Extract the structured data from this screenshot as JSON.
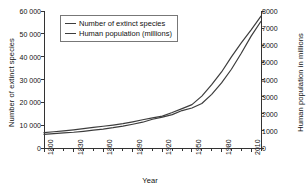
{
  "chart_data": {
    "type": "line",
    "title": "",
    "xlabel": "Year",
    "ylabel": "Number of extinct species",
    "ylabel_right": "Human population in millions",
    "xlim": [
      1800,
      2020
    ],
    "ylim": [
      0,
      60000
    ],
    "ylim_right": [
      0,
      8000
    ],
    "grid": false,
    "legend_position": "top-left-inside",
    "xticks": [
      1800,
      1830,
      1860,
      1890,
      1920,
      1950,
      1980,
      2010
    ],
    "xtick_labels": [
      "1800",
      "1830",
      "1860",
      "1890",
      "1920",
      "1950",
      "1980",
      "2010"
    ],
    "xminor_step": 10,
    "yticks_left": [
      0,
      10000,
      20000,
      30000,
      40000,
      50000,
      60000
    ],
    "ytick_labels_left": [
      "0",
      "10 000",
      "20 000",
      "30 000",
      "40 000",
      "50 000",
      "60 000"
    ],
    "yticks_right": [
      0,
      1000,
      2000,
      3000,
      4000,
      5000,
      6000,
      7000,
      8000
    ],
    "ytick_labels_right": [
      "0",
      "1000",
      "2000",
      "3000",
      "4000",
      "5000",
      "6000",
      "7000",
      "8000"
    ],
    "x": [
      1800,
      1810,
      1820,
      1830,
      1840,
      1850,
      1860,
      1870,
      1880,
      1890,
      1900,
      1910,
      1920,
      1930,
      1940,
      1950,
      1960,
      1970,
      1980,
      1990,
      2000,
      2010,
      2020
    ],
    "series": [
      {
        "name": "Number of extinct species",
        "axis": "left",
        "color": "#3d3d3d",
        "values": [
          6000,
          6300,
          6600,
          6900,
          7300,
          7800,
          8300,
          8900,
          9600,
          10400,
          11300,
          12600,
          13500,
          14600,
          16400,
          17500,
          19500,
          23500,
          28500,
          34500,
          41500,
          49000,
          55500
        ]
      },
      {
        "name": "Human population (millions)",
        "axis": "right",
        "color": "#3d3d3d",
        "values": [
          900,
          950,
          1000,
          1060,
          1130,
          1200,
          1270,
          1340,
          1420,
          1530,
          1650,
          1760,
          1860,
          2070,
          2300,
          2530,
          3030,
          3700,
          4440,
          5320,
          6140,
          6900,
          7700
        ]
      }
    ],
    "legend": [
      {
        "label": "Number of extinct species"
      },
      {
        "label": "Human population (millions)"
      }
    ]
  }
}
